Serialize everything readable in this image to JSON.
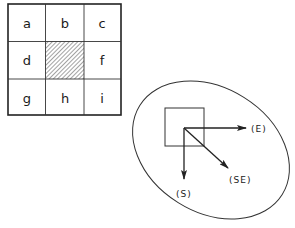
{
  "grid": {
    "cells": [
      {
        "label": "a",
        "shaded": false
      },
      {
        "label": "b",
        "shaded": false
      },
      {
        "label": "c",
        "shaded": false
      },
      {
        "label": "d",
        "shaded": false
      },
      {
        "label": "",
        "shaded": true
      },
      {
        "label": "f",
        "shaded": false
      },
      {
        "label": "g",
        "shaded": false
      },
      {
        "label": "h",
        "shaded": false
      },
      {
        "label": "i",
        "shaded": false
      }
    ]
  },
  "directions": {
    "east": "(E)",
    "southeast": "(SE)",
    "south": "(S)"
  },
  "colors": {
    "line": "#222222",
    "background": "#ffffff"
  }
}
